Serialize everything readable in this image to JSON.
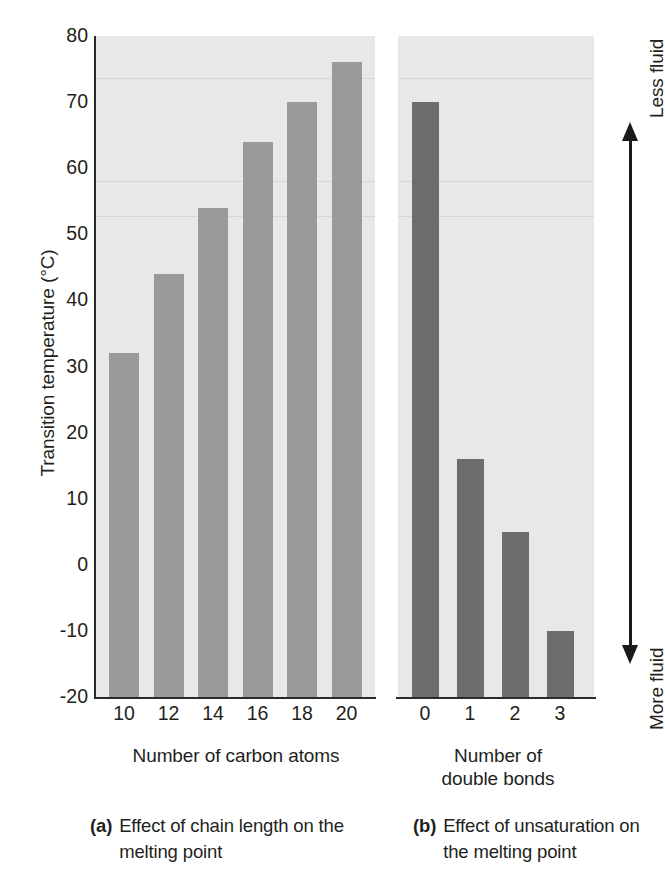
{
  "chart_data": [
    {
      "type": "bar",
      "panel": "a",
      "title": "",
      "categories": [
        "10",
        "12",
        "14",
        "16",
        "18",
        "20"
      ],
      "values": [
        32,
        44,
        54,
        64,
        70,
        76
      ],
      "xlabel": "Number of carbon atoms",
      "ylabel": "Transition temperature (°C)",
      "ylim": [
        -20,
        80
      ],
      "ytick_labels": [
        "80",
        "70",
        "60",
        "50",
        "40",
        "30",
        "20",
        "10",
        "0",
        "-10",
        "-20"
      ],
      "ytick_values": [
        80,
        70,
        60,
        50,
        40,
        30,
        20,
        10,
        0,
        -10,
        -20
      ],
      "grid": false,
      "legend": "none",
      "bar_color": "#9a9a99",
      "plot_background": "#e8e9e7",
      "caption_letter": "(a)",
      "caption_text": "Effect of chain length on the melting point"
    },
    {
      "type": "bar",
      "panel": "b",
      "title": "",
      "categories": [
        "0",
        "1",
        "2",
        "3"
      ],
      "values": [
        70,
        16,
        5,
        -10
      ],
      "xlabel": "Number of double bonds",
      "ylabel": "",
      "ylim": [
        -20,
        80
      ],
      "grid": false,
      "legend": "none",
      "bar_color": "#6d6d6c",
      "plot_background": "#e8e9e7",
      "caption_letter": "(b)",
      "caption_text": "Effect of unsaturation on the melting point"
    }
  ],
  "figure": {
    "y_axis_title": "Transition temperature (°C)",
    "panel_a": {
      "x_axis_title": "Number of carbon atoms",
      "caption_letter": "(a)",
      "caption_text": "Effect of chain length on the melting point"
    },
    "panel_b": {
      "x_axis_title_line1": "Number of",
      "x_axis_title_line2": "double bonds",
      "caption_letter": "(b)",
      "caption_text": "Effect of unsaturation on the melting point"
    },
    "fluidity_scale": {
      "top_label": "Less fluid",
      "bottom_label": "More fluid"
    },
    "colors": {
      "bar_light": "#9a9a99",
      "bar_dark": "#6d6d6c",
      "plot_background": "#e8e9e7",
      "axis": "#2b2b2b",
      "text": "#231f20"
    }
  }
}
